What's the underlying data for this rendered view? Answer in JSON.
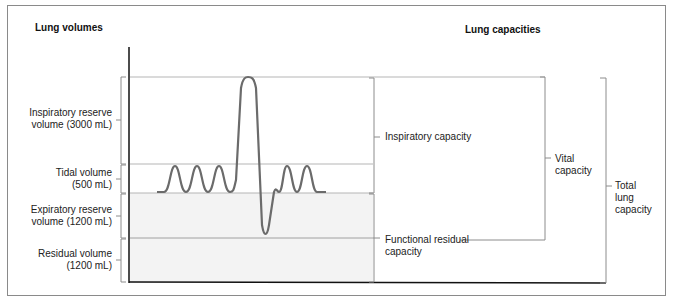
{
  "title_left": "Lung volumes",
  "title_right": "Lung capacities",
  "volumes": [
    {
      "line1": "Inspiratory reserve",
      "line2": "volume (3000 mL)"
    },
    {
      "line1": "Tidal volume",
      "line2": "(500 mL)"
    },
    {
      "line1": "Expiratory reserve",
      "line2": "volume (1200 mL)"
    },
    {
      "line1": "Residual volume",
      "line2": "(1200 mL)"
    }
  ],
  "capacities": {
    "inspiratory": "Inspiratory capacity",
    "frc_line1": "Functional residual",
    "frc_line2": "capacity",
    "vital_line1": "Vital",
    "vital_line2": "capacity",
    "tlc_line1": "Total",
    "tlc_line2": "lung",
    "tlc_line3": "capacity"
  },
  "colors": {
    "trace": "#6b6b6b",
    "axis": "#111111",
    "gridline": "#b5b5b5",
    "shade": "#f3f3f3",
    "bracket": "#8c8c8c"
  }
}
